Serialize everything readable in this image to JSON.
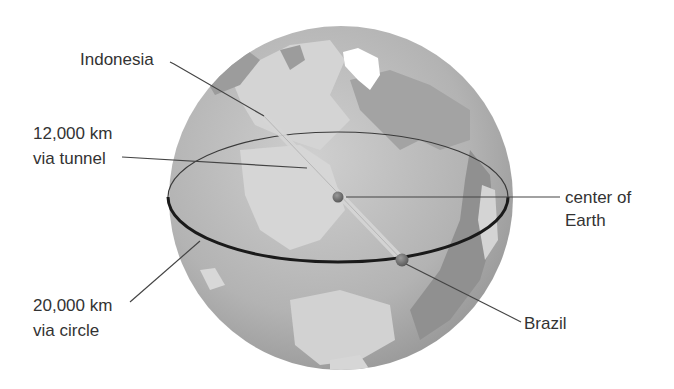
{
  "diagram": {
    "colors": {
      "background": "#ffffff",
      "ocean": "#a8a8a8",
      "land": "#c9c9c9",
      "ice": "#ffffff",
      "equator_circle": "#1a1a1a",
      "tunnel": "#d2d2d2",
      "leader_line": "#444444",
      "dot": "#707070",
      "text": "#333333"
    },
    "labels": {
      "indonesia": "Indonesia",
      "tunnel_distance": {
        "line1": "12,000 km",
        "line2": "via tunnel"
      },
      "center": {
        "line1": "center of",
        "line2": "Earth"
      },
      "circle_distance": {
        "line1": "20,000 km",
        "line2": "via circle"
      },
      "brazil": "Brazil"
    },
    "values": {
      "tunnel_km": 12000,
      "circle_km": 20000
    }
  }
}
